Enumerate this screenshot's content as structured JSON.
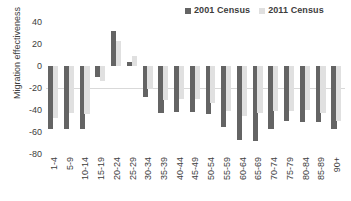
{
  "chart_data": {
    "type": "bar",
    "title": "",
    "xlabel": "",
    "ylabel": "Migration effectiveness",
    "ylim": [
      -80,
      40
    ],
    "yticks": [
      40,
      20,
      0,
      -20,
      -40,
      -60,
      -80
    ],
    "grid": false,
    "legend_position": "top-right",
    "categories": [
      "1-4",
      "5-9",
      "10-14",
      "15-19",
      "20-24",
      "25-29",
      "30-34",
      "35-39",
      "40-44",
      "45-49",
      "50-54",
      "55-59",
      "60-64",
      "65-69",
      "70-74",
      "75-79",
      "80-84",
      "85-89",
      "90+"
    ],
    "series": [
      {
        "name": "2001 Census",
        "color": "#646464",
        "values": [
          -57,
          -57,
          -57,
          -10,
          32,
          4,
          -28,
          -43,
          -42,
          -42,
          -44,
          -55,
          -67,
          -68,
          -57,
          -50,
          -51,
          -51,
          -57
        ]
      },
      {
        "name": "2011 Census",
        "color": "#e0e0e0",
        "values": [
          -47,
          -43,
          -44,
          -14,
          23,
          9,
          -21,
          -31,
          -30,
          -30,
          -34,
          -41,
          -45,
          -43,
          -41,
          -41,
          -40,
          -43,
          -50
        ]
      }
    ]
  },
  "legend": {
    "entries": [
      {
        "label": "2001 Census",
        "color": "#646464"
      },
      {
        "label": "2011 Census",
        "color": "#e0e0e0"
      }
    ]
  },
  "axes": {
    "y_title": "Migration effectiveness",
    "y_tick_labels": [
      "40",
      "20",
      "0",
      "-20",
      "-40",
      "-60",
      "-80"
    ],
    "x_tick_labels": [
      "1-4",
      "5-9",
      "10-14",
      "15-19",
      "20-24",
      "25-29",
      "30-34",
      "35-39",
      "40-44",
      "45-49",
      "50-54",
      "55-59",
      "60-64",
      "65-69",
      "70-74",
      "75-79",
      "80-84",
      "85-89",
      "90+"
    ]
  },
  "colors": {
    "series_2001": "#646464",
    "series_2011": "#e0e0e0",
    "text": "#3d3d3d",
    "zero_line": "#d9d9d9",
    "background": "#ffffff"
  }
}
